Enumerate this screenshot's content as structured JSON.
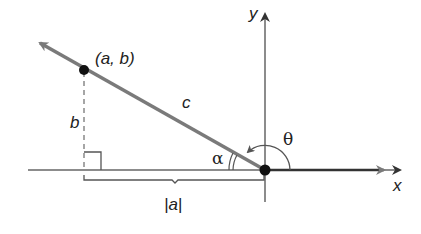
{
  "diagram": {
    "type": "coordinate-plane angle diagram",
    "axes": {
      "x_label": "x",
      "y_label": "y"
    },
    "point": {
      "label": "(a, b)"
    },
    "segments": {
      "hypotenuse_label": "c",
      "vertical_label": "b",
      "horizontal_label": "|a|"
    },
    "angles": {
      "reference_angle": "α",
      "standard_angle": "θ"
    },
    "colors": {
      "ray": "#7a7a7a",
      "axis": "#555555",
      "positive_x_ray": "#333333",
      "point": "#111111",
      "text": "#222222"
    }
  }
}
